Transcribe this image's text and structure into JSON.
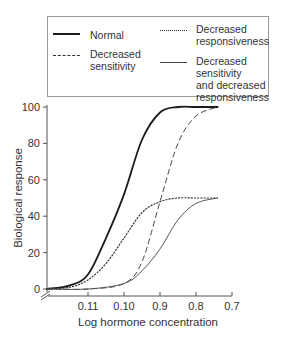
{
  "chart_data": {
    "type": "line",
    "title": "",
    "xlabel": "Log hormone concentration",
    "ylabel": "Biological response",
    "x_tick_labels": [
      "0.11",
      "0.10",
      "0.9",
      "0.8",
      "0.7"
    ],
    "y_tick_labels": [
      "0",
      "20",
      "40",
      "60",
      "80",
      "100"
    ],
    "y_ticks": [
      0,
      20,
      40,
      60,
      80,
      100
    ],
    "ylim": [
      0,
      100
    ],
    "grid": false,
    "legend_position": "top (boxed, above plot)",
    "x_note": "x values expressed as tick index: 0=0.11, 1=0.10, 2=0.9, 3=0.8, 4=0.7; axis starts at about -1.14 with a break mark",
    "series": [
      {
        "name": "Normal",
        "style": "solid-thick",
        "x": [
          -1.14,
          -0.5,
          0,
          0.5,
          1.0,
          1.5,
          2.0,
          2.5,
          3.0,
          3.6
        ],
        "values": [
          0,
          2,
          8,
          28,
          52,
          82,
          97,
          100,
          100,
          100
        ]
      },
      {
        "name": "Decreased sensitivity",
        "style": "dashed",
        "x": [
          -1.14,
          0,
          1.0,
          1.5,
          2.0,
          2.5,
          3.0,
          3.6
        ],
        "values": [
          0,
          0,
          3,
          15,
          48,
          80,
          95,
          100
        ]
      },
      {
        "name": "Decreased responsiveness",
        "style": "dotted",
        "x": [
          -1.14,
          -0.5,
          0,
          0.5,
          1.0,
          1.5,
          2.0,
          2.5,
          3.0,
          3.6
        ],
        "values": [
          0,
          1,
          5,
          14,
          28,
          42,
          48,
          50,
          50,
          50
        ]
      },
      {
        "name": "Decreased sensitivity and decreased responsiveness",
        "style": "solid-thin",
        "x": [
          -1.14,
          0,
          1.0,
          1.5,
          2.0,
          2.5,
          3.0,
          3.6
        ],
        "values": [
          0,
          0,
          3,
          10,
          22,
          38,
          47,
          50
        ]
      }
    ]
  },
  "legend": {
    "items": [
      {
        "label_lines": [
          "Normal"
        ],
        "style": "solid-thick"
      },
      {
        "label_lines": [
          "Decreased",
          "sensitivity"
        ],
        "style": "dashed"
      },
      {
        "label_lines": [
          "Decreased",
          "responsiveness"
        ],
        "style": "dotted"
      },
      {
        "label_lines": [
          "Decreased",
          "sensitivity",
          "and decreased",
          "responsiveness"
        ],
        "style": "solid-thin"
      }
    ]
  },
  "colors": {
    "line": "#1a1a1a",
    "thin_line": "#444444",
    "frame": "#9a9a9a",
    "axis": "#555555"
  }
}
